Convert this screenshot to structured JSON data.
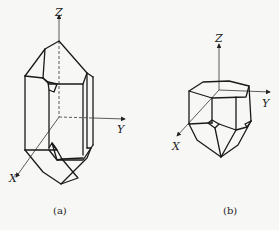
{
  "figure": {
    "panels": [
      {
        "id": "a",
        "caption": "(a)",
        "axes": {
          "z_label": "Z",
          "y_label": "Y",
          "x_label": "X"
        },
        "description": "Elongated hexagonal prism crystal with pyramidal terminations"
      },
      {
        "id": "b",
        "caption": "(b)",
        "axes": {
          "z_label": "Z",
          "y_label": "Y",
          "x_label": "X"
        },
        "description": "Short hexagonal prism crystal with flat top and pyramidal bottom termination"
      }
    ],
    "colors": {
      "line": "#1a1a1a",
      "background": "#f7f7f5"
    }
  }
}
